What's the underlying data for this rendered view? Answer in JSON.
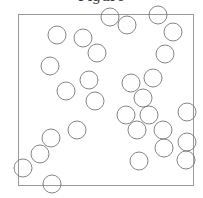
{
  "figure": {
    "title": "Figure",
    "box": {
      "x": 18,
      "y": 14,
      "width": 175,
      "height": 171,
      "stroke": "#999999"
    },
    "circle_radius": 9,
    "circle_stroke": "#777777",
    "circles": [
      {
        "cx": 110,
        "cy": 17
      },
      {
        "cx": 127,
        "cy": 25
      },
      {
        "cx": 158,
        "cy": 15
      },
      {
        "cx": 57,
        "cy": 35
      },
      {
        "cx": 83,
        "cy": 38
      },
      {
        "cx": 173,
        "cy": 32
      },
      {
        "cx": 97,
        "cy": 53
      },
      {
        "cx": 165,
        "cy": 54
      },
      {
        "cx": 50,
        "cy": 66
      },
      {
        "cx": 66,
        "cy": 91
      },
      {
        "cx": 89,
        "cy": 80
      },
      {
        "cx": 95,
        "cy": 101
      },
      {
        "cx": 131,
        "cy": 83
      },
      {
        "cx": 153,
        "cy": 78
      },
      {
        "cx": 143,
        "cy": 98
      },
      {
        "cx": 126,
        "cy": 115
      },
      {
        "cx": 149,
        "cy": 115
      },
      {
        "cx": 137,
        "cy": 130
      },
      {
        "cx": 163,
        "cy": 130
      },
      {
        "cx": 164,
        "cy": 148
      },
      {
        "cx": 139,
        "cy": 161
      },
      {
        "cx": 187,
        "cy": 112
      },
      {
        "cx": 187,
        "cy": 142
      },
      {
        "cx": 186,
        "cy": 160
      },
      {
        "cx": 77,
        "cy": 130
      },
      {
        "cx": 51,
        "cy": 138
      },
      {
        "cx": 40,
        "cy": 154
      },
      {
        "cx": 23,
        "cy": 168
      },
      {
        "cx": 52,
        "cy": 184
      }
    ]
  }
}
